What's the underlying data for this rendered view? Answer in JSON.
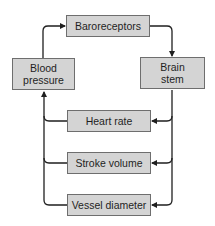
{
  "diagram": {
    "type": "feedback-loop flowchart",
    "colors": {
      "box_fill": "#d4d4d4",
      "box_border": "#6e6e6e",
      "line": "#1f1f1f",
      "text": "#1f1f1f"
    },
    "nodes": {
      "baroreceptors": {
        "label": "Baroreceptors"
      },
      "brain_stem": {
        "label": "Brain stem",
        "line1": "Brain",
        "line2": "stem"
      },
      "blood_pressure": {
        "label": "Blood pressure",
        "line1": "Blood",
        "line2": "pressure"
      },
      "heart_rate": {
        "label": "Heart rate"
      },
      "stroke_volume": {
        "label": "Stroke volume"
      },
      "vessel_diameter": {
        "label": "Vessel diameter"
      }
    },
    "edges": [
      {
        "from": "Blood pressure",
        "to": "Baroreceptors"
      },
      {
        "from": "Baroreceptors",
        "to": "Brain stem"
      },
      {
        "from": "Brain stem",
        "to": "Heart rate"
      },
      {
        "from": "Brain stem",
        "to": "Stroke volume"
      },
      {
        "from": "Brain stem",
        "to": "Vessel diameter"
      },
      {
        "from": "Heart rate",
        "to": "Blood pressure"
      },
      {
        "from": "Stroke volume",
        "to": "Blood pressure"
      },
      {
        "from": "Vessel diameter",
        "to": "Blood pressure"
      }
    ]
  }
}
